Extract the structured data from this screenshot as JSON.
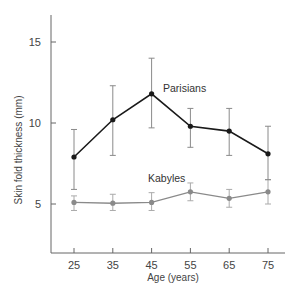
{
  "chart_data": {
    "type": "line",
    "title": "",
    "xlabel": "Age (years)",
    "ylabel": "Skin fold thickness (mm)",
    "x": [
      25,
      35,
      45,
      55,
      65,
      75
    ],
    "xticks": [
      "25",
      "35",
      "45",
      "55",
      "65",
      "75"
    ],
    "yticks": [
      "5",
      "10",
      "15"
    ],
    "ylim": [
      2,
      17
    ],
    "xlim": [
      20,
      82
    ],
    "grid": false,
    "legend": "inline labels",
    "series": [
      {
        "name": "Parisians",
        "color": "#1a1a1a",
        "values": [
          7.9,
          10.2,
          11.8,
          9.8,
          9.5,
          8.1
        ],
        "error_low": [
          5.9,
          8.0,
          9.7,
          8.5,
          8.0,
          6.5
        ],
        "error_high": [
          9.6,
          12.3,
          14.0,
          10.9,
          10.9,
          9.8
        ]
      },
      {
        "name": "Kabyles",
        "color": "#8a8a8a",
        "values": [
          5.1,
          5.05,
          5.1,
          5.75,
          5.35,
          5.75
        ],
        "error_low": [
          4.6,
          4.6,
          4.6,
          5.2,
          4.8,
          5.0
        ],
        "error_high": [
          5.5,
          5.6,
          5.7,
          6.3,
          5.9,
          6.5
        ]
      }
    ]
  },
  "labels": {
    "parisians": "Parisians",
    "kabyles": "Kabyles",
    "xlabel": "Age (years)",
    "ylabel": "Skin fold thickness (mm)"
  }
}
